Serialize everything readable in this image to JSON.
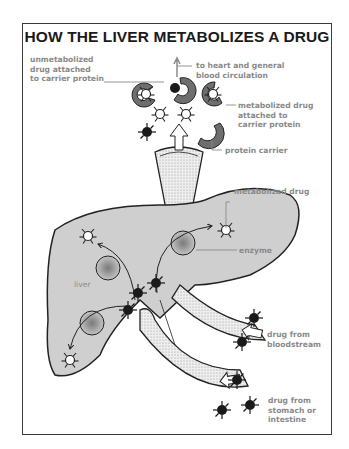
{
  "title": "HOW THE LIVER METABOLIZES A DRUG",
  "labels": {
    "unmetabolized": "unmetabolized\ndrug attached\nto carrier protein",
    "to_heart": "to heart and general\nblood circulation",
    "metabolized_attached": "metabolized drug\nattached to\ncarrier protein",
    "protein_carrier": "protein carrier",
    "metabolized_drug": "metabolized drug",
    "enzyme": "enzyme",
    "liver": "liver",
    "from_bloodstream": "drug from\nbloodstream",
    "from_stomach": "drug from\nstomach or\nintestine"
  },
  "colors": {
    "liver_fill": "#cfcfcf",
    "outline": "#222222",
    "carrier_fill": "#6e6e6e",
    "drug_dark": "#1a1a1a",
    "label_text": "#8a8a8a",
    "vessel_fill": "#e6e6e6"
  }
}
